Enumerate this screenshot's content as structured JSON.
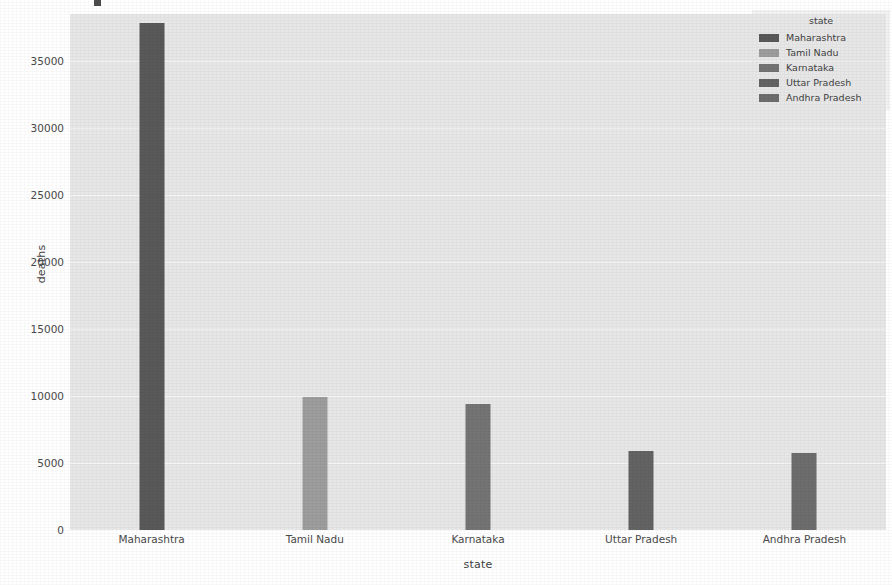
{
  "chart_data": {
    "type": "bar",
    "title": "",
    "xlabel": "state",
    "ylabel": "deaths",
    "categories": [
      "Maharashtra",
      "Tamil Nadu",
      "Karnataka",
      "Uttar Pradesh",
      "Andhra Pradesh"
    ],
    "values": [
      37800,
      9900,
      9400,
      5900,
      5750
    ],
    "ylim": [
      0,
      38500
    ],
    "yticks": [
      0,
      5000,
      10000,
      15000,
      20000,
      25000,
      30000,
      35000
    ],
    "ytick_labels": [
      "0",
      "5000",
      "10000",
      "15000",
      "20000",
      "25000",
      "30000",
      "35000"
    ],
    "grid": true,
    "legend": {
      "title": "state",
      "position": "upper right",
      "entries": [
        {
          "label": "Maharashtra",
          "color": "#595959"
        },
        {
          "label": "Tamil Nadu",
          "color": "#9d9d9d"
        },
        {
          "label": "Karnataka",
          "color": "#747474"
        },
        {
          "label": "Uttar Pradesh",
          "color": "#636363"
        },
        {
          "label": "Andhra Pradesh",
          "color": "#6d6d6d"
        }
      ]
    },
    "bar_colors": [
      "#595959",
      "#9d9d9d",
      "#747474",
      "#636363",
      "#6d6d6d"
    ],
    "plot_background": "#e7e7e7",
    "gridline_color": "#f4f4f4",
    "figure_background": "#ffffff"
  }
}
